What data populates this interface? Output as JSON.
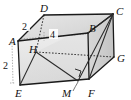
{
  "figure": {
    "type": "3d-geometry-diagram",
    "shape": "rectangular-prism",
    "background_color": "#ffffff",
    "edge_color": "#1a1a1a",
    "hidden_edge_style": "dashed",
    "face_shading": {
      "front": "#e3e3e3",
      "top": "#d9d9d9",
      "right": "#cfcfcf",
      "inner_left": "#dedede"
    }
  },
  "vertices": [
    {
      "id": "A",
      "label": "A",
      "x": 18,
      "y": 41,
      "label_x": 9,
      "label_y": 45,
      "hidden": false
    },
    {
      "id": "B",
      "label": "B",
      "x": 88,
      "y": 33,
      "label_x": 89,
      "label_y": 32,
      "hidden": false
    },
    {
      "id": "C",
      "label": "C",
      "x": 113,
      "y": 14,
      "label_x": 116,
      "label_y": 13,
      "hidden": false
    },
    {
      "id": "D",
      "label": "D",
      "x": 44,
      "y": 15,
      "label_x": 41,
      "label_y": 11,
      "hidden": false
    },
    {
      "id": "E",
      "label": "E",
      "x": 20,
      "y": 85,
      "label_x": 16,
      "label_y": 96,
      "hidden": false
    },
    {
      "id": "F",
      "label": "F",
      "x": 89,
      "y": 79,
      "label_x": 90,
      "label_y": 95,
      "hidden": false
    },
    {
      "id": "G",
      "label": "G",
      "x": 114,
      "y": 57,
      "label_x": 117,
      "label_y": 61,
      "hidden": false
    },
    {
      "id": "H",
      "label": "H",
      "x": 36,
      "y": 52,
      "label_x": 31,
      "label_y": 51,
      "hidden": true
    },
    {
      "id": "M",
      "label": "M",
      "x": 78,
      "y": 81,
      "label_x": 65,
      "label_y": 95,
      "hidden": false
    }
  ],
  "edges": [
    {
      "from": "A",
      "to": "B",
      "style": "solid",
      "name": "edge-AB"
    },
    {
      "from": "A",
      "to": "D",
      "style": "solid",
      "name": "edge-AD"
    },
    {
      "from": "A",
      "to": "E",
      "style": "solid",
      "name": "edge-AE"
    },
    {
      "from": "D",
      "to": "C",
      "style": "solid",
      "name": "edge-DC"
    },
    {
      "from": "B",
      "to": "C",
      "style": "solid",
      "name": "edge-BC"
    },
    {
      "from": "B",
      "to": "F",
      "style": "solid",
      "name": "edge-BF"
    },
    {
      "from": "C",
      "to": "G",
      "style": "solid",
      "name": "edge-CG"
    },
    {
      "from": "E",
      "to": "F",
      "style": "solid",
      "name": "edge-EF"
    },
    {
      "from": "F",
      "to": "G",
      "style": "solid",
      "name": "edge-FG"
    },
    {
      "from": "D",
      "to": "H",
      "style": "hidden",
      "name": "edge-DH"
    },
    {
      "from": "H",
      "to": "E",
      "style": "hidden",
      "name": "edge-HE-hidden"
    },
    {
      "from": "H",
      "to": "G",
      "style": "hidden",
      "name": "edge-HG"
    }
  ],
  "inner_lines": [
    {
      "from": "H",
      "to": "E",
      "style": "solid",
      "name": "line-HE"
    },
    {
      "from": "H",
      "to": "M",
      "style": "solid",
      "name": "line-HM"
    },
    {
      "from": "C",
      "to": "M",
      "style": "solid",
      "name": "line-CM"
    },
    {
      "from": "C",
      "to": "F",
      "style": "solid",
      "name": "line-CF"
    },
    {
      "from": "C",
      "to": "B",
      "style": "solid",
      "name": "line-CB"
    }
  ],
  "dimensions": [
    {
      "id": "dim-AD",
      "value": "2",
      "label_x": 25,
      "label_y": 28,
      "from": "A",
      "to": "D",
      "description": "depth edge A to D equals 2"
    },
    {
      "id": "dim-AB",
      "value": "4",
      "label_x": 54,
      "label_y": 38,
      "from": "A",
      "to": "B",
      "description": "width A to B equals 4"
    },
    {
      "id": "dim-AE",
      "value": "2",
      "label_x": 6,
      "label_y": 69,
      "from": "A",
      "to": "E",
      "description": "height A to E equals 2"
    }
  ],
  "markers": [
    {
      "id": "right-angle-M",
      "type": "right-angle",
      "at": "M",
      "x": 79,
      "y": 72,
      "description": "right angle between HM and CM at point M"
    }
  ],
  "leaders": [
    {
      "id": "leader-M",
      "from_x": 73,
      "from_y": 91,
      "to_x": 78,
      "to_y": 82,
      "description": "leader line from label M to point M on edge EF"
    }
  ]
}
